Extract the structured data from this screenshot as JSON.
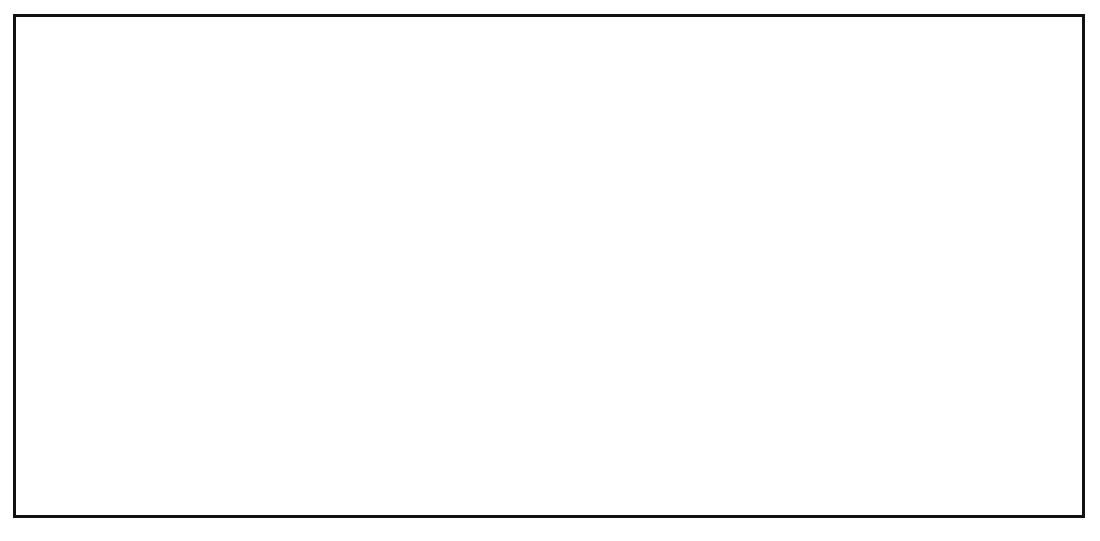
{
  "figure": {
    "panels": [
      {
        "id": "left",
        "y_axis": {
          "label": "PCT (ng/mL)",
          "ticks": [
            0,
            10,
            20,
            30,
            40,
            50,
            60
          ],
          "min": 0,
          "max": 60
        },
        "group_labels": [
          "Group A",
          "Group B"
        ],
        "legend": {
          "entries": [
            {
              "marker": "circle-filled",
              "label": "Day 1"
            },
            {
              "marker": "triangle-filled",
              "label": "Day 2"
            },
            {
              "marker": "diamond-filled",
              "label": "Day 3"
            },
            {
              "marker": "square-filled",
              "label": "Day 5"
            }
          ]
        }
      },
      {
        "id": "right",
        "y_axis": {
          "label": "PCT (ng/mL)",
          "ticks": [
            0,
            10,
            20,
            30,
            40,
            50,
            60
          ],
          "min": 0,
          "max": 60
        },
        "group_labels": [
          "Group C",
          "Group D"
        ],
        "legend": {
          "entries": [
            {
              "marker": "circle-open",
              "label": "Before ECC"
            },
            {
              "marker": "triangle-open",
              "label": "During ECC"
            },
            {
              "marker": "diamond-open",
              "label": "Day 1 after ECC"
            },
            {
              "marker": "square-open",
              "label": "Day 2 after ECC"
            }
          ]
        }
      }
    ]
  },
  "chart_data": {
    "type": "boxplot",
    "title": "",
    "ylabel": "PCT (ng/mL)",
    "xlabel": "",
    "ylim": [
      0,
      60
    ],
    "yticks": [
      0,
      10,
      20,
      30,
      40,
      50,
      60
    ],
    "grid": "horizontal-dotted",
    "significance_marker": "*",
    "panels": [
      {
        "name": "left",
        "legend_position": "top-left",
        "legend_entries": [
          "Day 1",
          "Day 2",
          "Day 3",
          "Day 5"
        ],
        "groups": [
          {
            "group": "Group A",
            "fill": "#e3e3e3",
            "boxes": [
              {
                "timepoint": "Day 1",
                "marker": "circle-filled",
                "whisker_low": 0.2,
                "q1": 1.4,
                "q3": 14.9,
                "whisker_high": 15.8,
                "median_marker_value": 4.3,
                "significant": false
              },
              {
                "timepoint": "Day 2",
                "marker": "triangle-filled",
                "whisker_low": 0.2,
                "q1": 0.5,
                "q3": 4.4,
                "whisker_high": 9.7,
                "median_marker_value": 3.2,
                "significant": false
              },
              {
                "timepoint": "Day 3",
                "marker": "diamond-filled",
                "whisker_low": 0.2,
                "q1": 0.4,
                "q3": 4.3,
                "whisker_high": 4.3,
                "median_marker_value": 2.1,
                "significant": false
              },
              {
                "timepoint": "Day 5",
                "marker": "square-filled",
                "whisker_low": 0.3,
                "q1": 0.6,
                "q3": 3.0,
                "whisker_high": 4.1,
                "median_marker_value": 2.2,
                "significant": false
              }
            ]
          },
          {
            "group": "Group B",
            "fill": "#e3e3e3",
            "boxes": [
              {
                "timepoint": "Day 1",
                "marker": "circle-filled",
                "whisker_low": 1.1,
                "q1": 4.6,
                "q3": 14.3,
                "whisker_high": 15.4,
                "median_marker_value": 10.6,
                "significant": false
              },
              {
                "timepoint": "Day 2",
                "marker": "triangle-filled",
                "whisker_low": 2.7,
                "q1": 4.0,
                "q3": 21.6,
                "whisker_high": 21.9,
                "median_marker_value": 14.1,
                "significant": true
              },
              {
                "timepoint": "Day 3",
                "marker": "diamond-filled",
                "whisker_low": 0.3,
                "q1": 5.9,
                "q3": 32.7,
                "whisker_high": 51.5,
                "median_marker_value": 16.2,
                "significant": true
              },
              {
                "timepoint": "Day 5",
                "marker": "square-filled",
                "whisker_low": 2.6,
                "q1": 3.1,
                "q3": 40.6,
                "whisker_high": 40.6,
                "median_marker_value": 23.0,
                "significant": true
              }
            ]
          }
        ]
      },
      {
        "name": "right",
        "legend_position": "top-left",
        "legend_entries": [
          "Before ECC",
          "During ECC",
          "Day 1 after ECC",
          "Day 2 after ECC"
        ],
        "groups": [
          {
            "group": "Group C",
            "fill": "#8a8a8a",
            "boxes": [
              {
                "timepoint": "Before ECC",
                "marker": "circle-open",
                "whisker_low": 0.05,
                "q1": 0.1,
                "q3": 0.45,
                "whisker_high": 0.5,
                "median_marker_value": 0.3,
                "significant": false
              },
              {
                "timepoint": "During ECC",
                "marker": "triangle-open",
                "whisker_low": 0.05,
                "q1": 0.1,
                "q3": 0.5,
                "whisker_high": 0.6,
                "median_marker_value": 0.3,
                "significant": false
              },
              {
                "timepoint": "Day 1 after ECC",
                "marker": "diamond-open",
                "whisker_low": 0.05,
                "q1": 0.1,
                "q3": 0.5,
                "whisker_high": 0.6,
                "median_marker_value": 0.35,
                "significant": false
              },
              {
                "timepoint": "Day 2 after ECC",
                "marker": "square-open",
                "whisker_low": 0.05,
                "q1": 0.15,
                "q3": 0.6,
                "whisker_high": 0.7,
                "median_marker_value": 0.4,
                "significant": false
              }
            ]
          },
          {
            "group": "Group D",
            "fill": "#8a8a8a",
            "boxes": [
              {
                "timepoint": "Before ECC",
                "marker": "circle-open",
                "whisker_low": 0.05,
                "q1": 0.1,
                "q3": 0.4,
                "whisker_high": 0.45,
                "median_marker_value": 0.25,
                "significant": false
              },
              {
                "timepoint": "During ECC",
                "marker": "triangle-open",
                "whisker_low": 0.05,
                "q1": 0.1,
                "q3": 0.45,
                "whisker_high": 0.5,
                "median_marker_value": 0.3,
                "significant": false
              },
              {
                "timepoint": "Day 1 after ECC",
                "marker": "circle-open",
                "whisker_low": 0.2,
                "q1": 0.2,
                "q3": 16.0,
                "whisker_high": 22.9,
                "median_marker_value": 3.7,
                "significant": true
              },
              {
                "timepoint": "Day 2 after ECC",
                "marker": "square-open",
                "whisker_low": 0.3,
                "q1": 0.5,
                "q3": 13.0,
                "whisker_high": 13.4,
                "median_marker_value": 3.2,
                "significant": true
              }
            ]
          }
        ]
      }
    ]
  }
}
